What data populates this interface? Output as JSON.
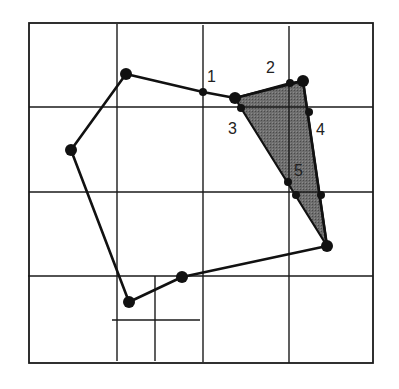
{
  "diagram": {
    "type": "polygon-clipping-grid",
    "colors": {
      "background": "#ffffff",
      "lines": "#1a1a1a",
      "fill": "#6e6e6e"
    },
    "frame": {
      "x1": 29,
      "y1": 23,
      "x2": 373,
      "y2": 363
    },
    "grid": {
      "verticals": [
        {
          "x": 117,
          "y1": 24,
          "y2": 361
        },
        {
          "x": 203,
          "y1": 25,
          "y2": 362
        },
        {
          "x": 289,
          "y1": 26,
          "y2": 363
        },
        {
          "x": 155,
          "y1": 276,
          "y2": 361
        }
      ],
      "horizontals": [
        {
          "y": 107,
          "x1": 29,
          "x2": 373
        },
        {
          "y": 192,
          "x1": 29,
          "x2": 373
        },
        {
          "y": 276,
          "x1": 28,
          "x2": 373
        },
        {
          "y": 320,
          "x1": 112,
          "x2": 200
        }
      ]
    },
    "polygon_vertices": [
      {
        "x": 126,
        "y": 74
      },
      {
        "x": 203,
        "y": 92
      },
      {
        "x": 235,
        "y": 98
      },
      {
        "x": 303,
        "y": 81
      },
      {
        "x": 327,
        "y": 246
      },
      {
        "x": 182,
        "y": 277
      },
      {
        "x": 129,
        "y": 302
      },
      {
        "x": 71,
        "y": 150
      }
    ],
    "clipped_region": [
      {
        "x": 235,
        "y": 98
      },
      {
        "x": 290,
        "y": 83
      },
      {
        "x": 303,
        "y": 81
      },
      {
        "x": 327,
        "y": 246
      },
      {
        "x": 241,
        "y": 108
      }
    ],
    "large_points": [
      {
        "x": 126,
        "y": 74
      },
      {
        "x": 71,
        "y": 150
      },
      {
        "x": 235,
        "y": 98
      },
      {
        "x": 303,
        "y": 81
      },
      {
        "x": 327,
        "y": 246
      },
      {
        "x": 182,
        "y": 277
      },
      {
        "x": 129,
        "y": 302
      }
    ],
    "small_points": [
      {
        "x": 203,
        "y": 92
      },
      {
        "x": 290,
        "y": 83
      },
      {
        "x": 241,
        "y": 108
      },
      {
        "x": 309,
        "y": 112
      },
      {
        "x": 288,
        "y": 182
      },
      {
        "x": 296,
        "y": 195
      },
      {
        "x": 321,
        "y": 195
      }
    ],
    "labels": [
      {
        "text": "1",
        "x": 207,
        "y": 82
      },
      {
        "text": "2",
        "x": 266,
        "y": 73
      },
      {
        "text": "3",
        "x": 228,
        "y": 134
      },
      {
        "text": "4",
        "x": 316,
        "y": 135
      },
      {
        "text": "5",
        "x": 294,
        "y": 176
      }
    ]
  }
}
